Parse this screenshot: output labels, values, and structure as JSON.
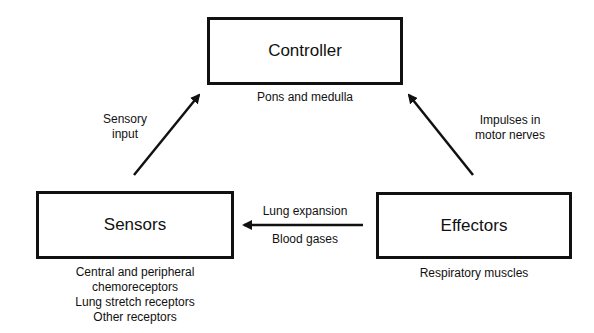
{
  "nodes": {
    "controller": {
      "title": "Controller",
      "subtitle": "Pons and medulla"
    },
    "sensors": {
      "title": "Sensors",
      "details": [
        "Central and peripheral",
        "chemoreceptors",
        "Lung stretch receptors",
        "Other receptors"
      ]
    },
    "effectors": {
      "title": "Effectors",
      "subtitle": "Respiratory muscles"
    }
  },
  "edges": {
    "sensors_to_controller": {
      "lines": [
        "Sensory",
        "input"
      ]
    },
    "effectors_to_controller": {
      "lines": [
        "Impulses in",
        "motor nerves"
      ]
    },
    "effectors_to_sensors": {
      "above": "Lung expansion",
      "below": "Blood gases"
    }
  },
  "colors": {
    "stroke": "#111111",
    "background": "#ffffff"
  }
}
